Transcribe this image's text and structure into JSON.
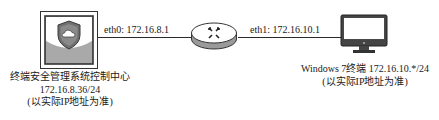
{
  "diagram": {
    "type": "network-topology",
    "nodes": {
      "server": {
        "icon": "shield-cloud-server-icon",
        "name": "终端安全管理系统控制中心",
        "ip": "172.16.8.36/24",
        "note": "(以实际IP地址为准)"
      },
      "router": {
        "icon": "router-icon"
      },
      "client": {
        "icon": "monitor-icon",
        "name_ip": "Windows 7终端 172.16.10.*/24",
        "note": "(以实际IP地址为准)"
      }
    },
    "links": [
      {
        "from": "server",
        "to": "router",
        "label": "eth0: 172.16.8.1"
      },
      {
        "from": "router",
        "to": "client",
        "label": "eth1: 172.16.10.1"
      }
    ],
    "colors": {
      "line": "#2a2a2a",
      "panel_gray": "#a9a9a9",
      "router_side": "#9a9a9a"
    }
  }
}
